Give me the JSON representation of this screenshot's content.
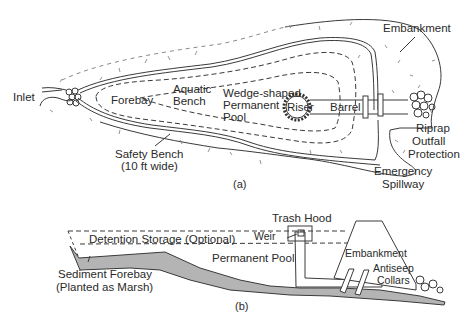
{
  "figure_a": {
    "caption": "(a)",
    "labels": {
      "inlet": "Inlet",
      "forebay": "Forebay",
      "aquatic_bench_1": "Aquatic",
      "aquatic_bench_2": "Bench",
      "pool_1": "Wedge-shaped",
      "pool_2": "Permanent",
      "pool_3": "Pool",
      "riser": "Riser",
      "barrel": "Barrel",
      "embankment": "Embankment",
      "riprap_1": "Riprap",
      "riprap_2": "Outfall",
      "riprap_3": "Protection",
      "safety_bench_1": "Safety Bench",
      "safety_bench_2": "(10 ft wide)",
      "spillway_1": "Emergency",
      "spillway_2": "Spillway"
    }
  },
  "figure_b": {
    "caption": "(b)",
    "labels": {
      "trash_hood": "Trash Hood",
      "weir": "Weir",
      "detention": "Detention Storage (Optional)",
      "permanent_pool": "Permanent Pool",
      "embankment": "Embankment",
      "antiseep_1": "Antiseep",
      "antiseep_2": "Collars",
      "forebay_1": "Sediment Forebay",
      "forebay_2": "(Planted as Marsh)"
    }
  },
  "colors": {
    "line": "#3a3a3a",
    "ground_fill": "#b4b4b4",
    "text": "#2a2a2a"
  }
}
